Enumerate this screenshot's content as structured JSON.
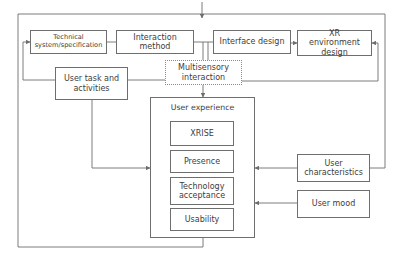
{
  "diagram": {
    "top_row": [
      {
        "id": "technical",
        "label": "Technical system/specification"
      },
      {
        "id": "interaction_method",
        "label": "Interaction method"
      },
      {
        "id": "interface_design",
        "label": "Interface design"
      },
      {
        "id": "xr_environment",
        "label": "XR environment design"
      }
    ],
    "user_task": {
      "label": "User task and activities"
    },
    "multisensory": {
      "label": "Multisensory interaction",
      "style": "dotted"
    },
    "user_experience": {
      "title": "User experience",
      "components": [
        {
          "label": "XRISE"
        },
        {
          "label": "Presence"
        },
        {
          "label": "Technology acceptance"
        },
        {
          "label": "Usability"
        }
      ]
    },
    "user_characteristics": {
      "label": "User characteristics"
    },
    "user_mood": {
      "label": "User mood"
    },
    "colors": {
      "line": "#6e6e6e",
      "text": "#3d3d3d",
      "background": "#ffffff"
    }
  }
}
